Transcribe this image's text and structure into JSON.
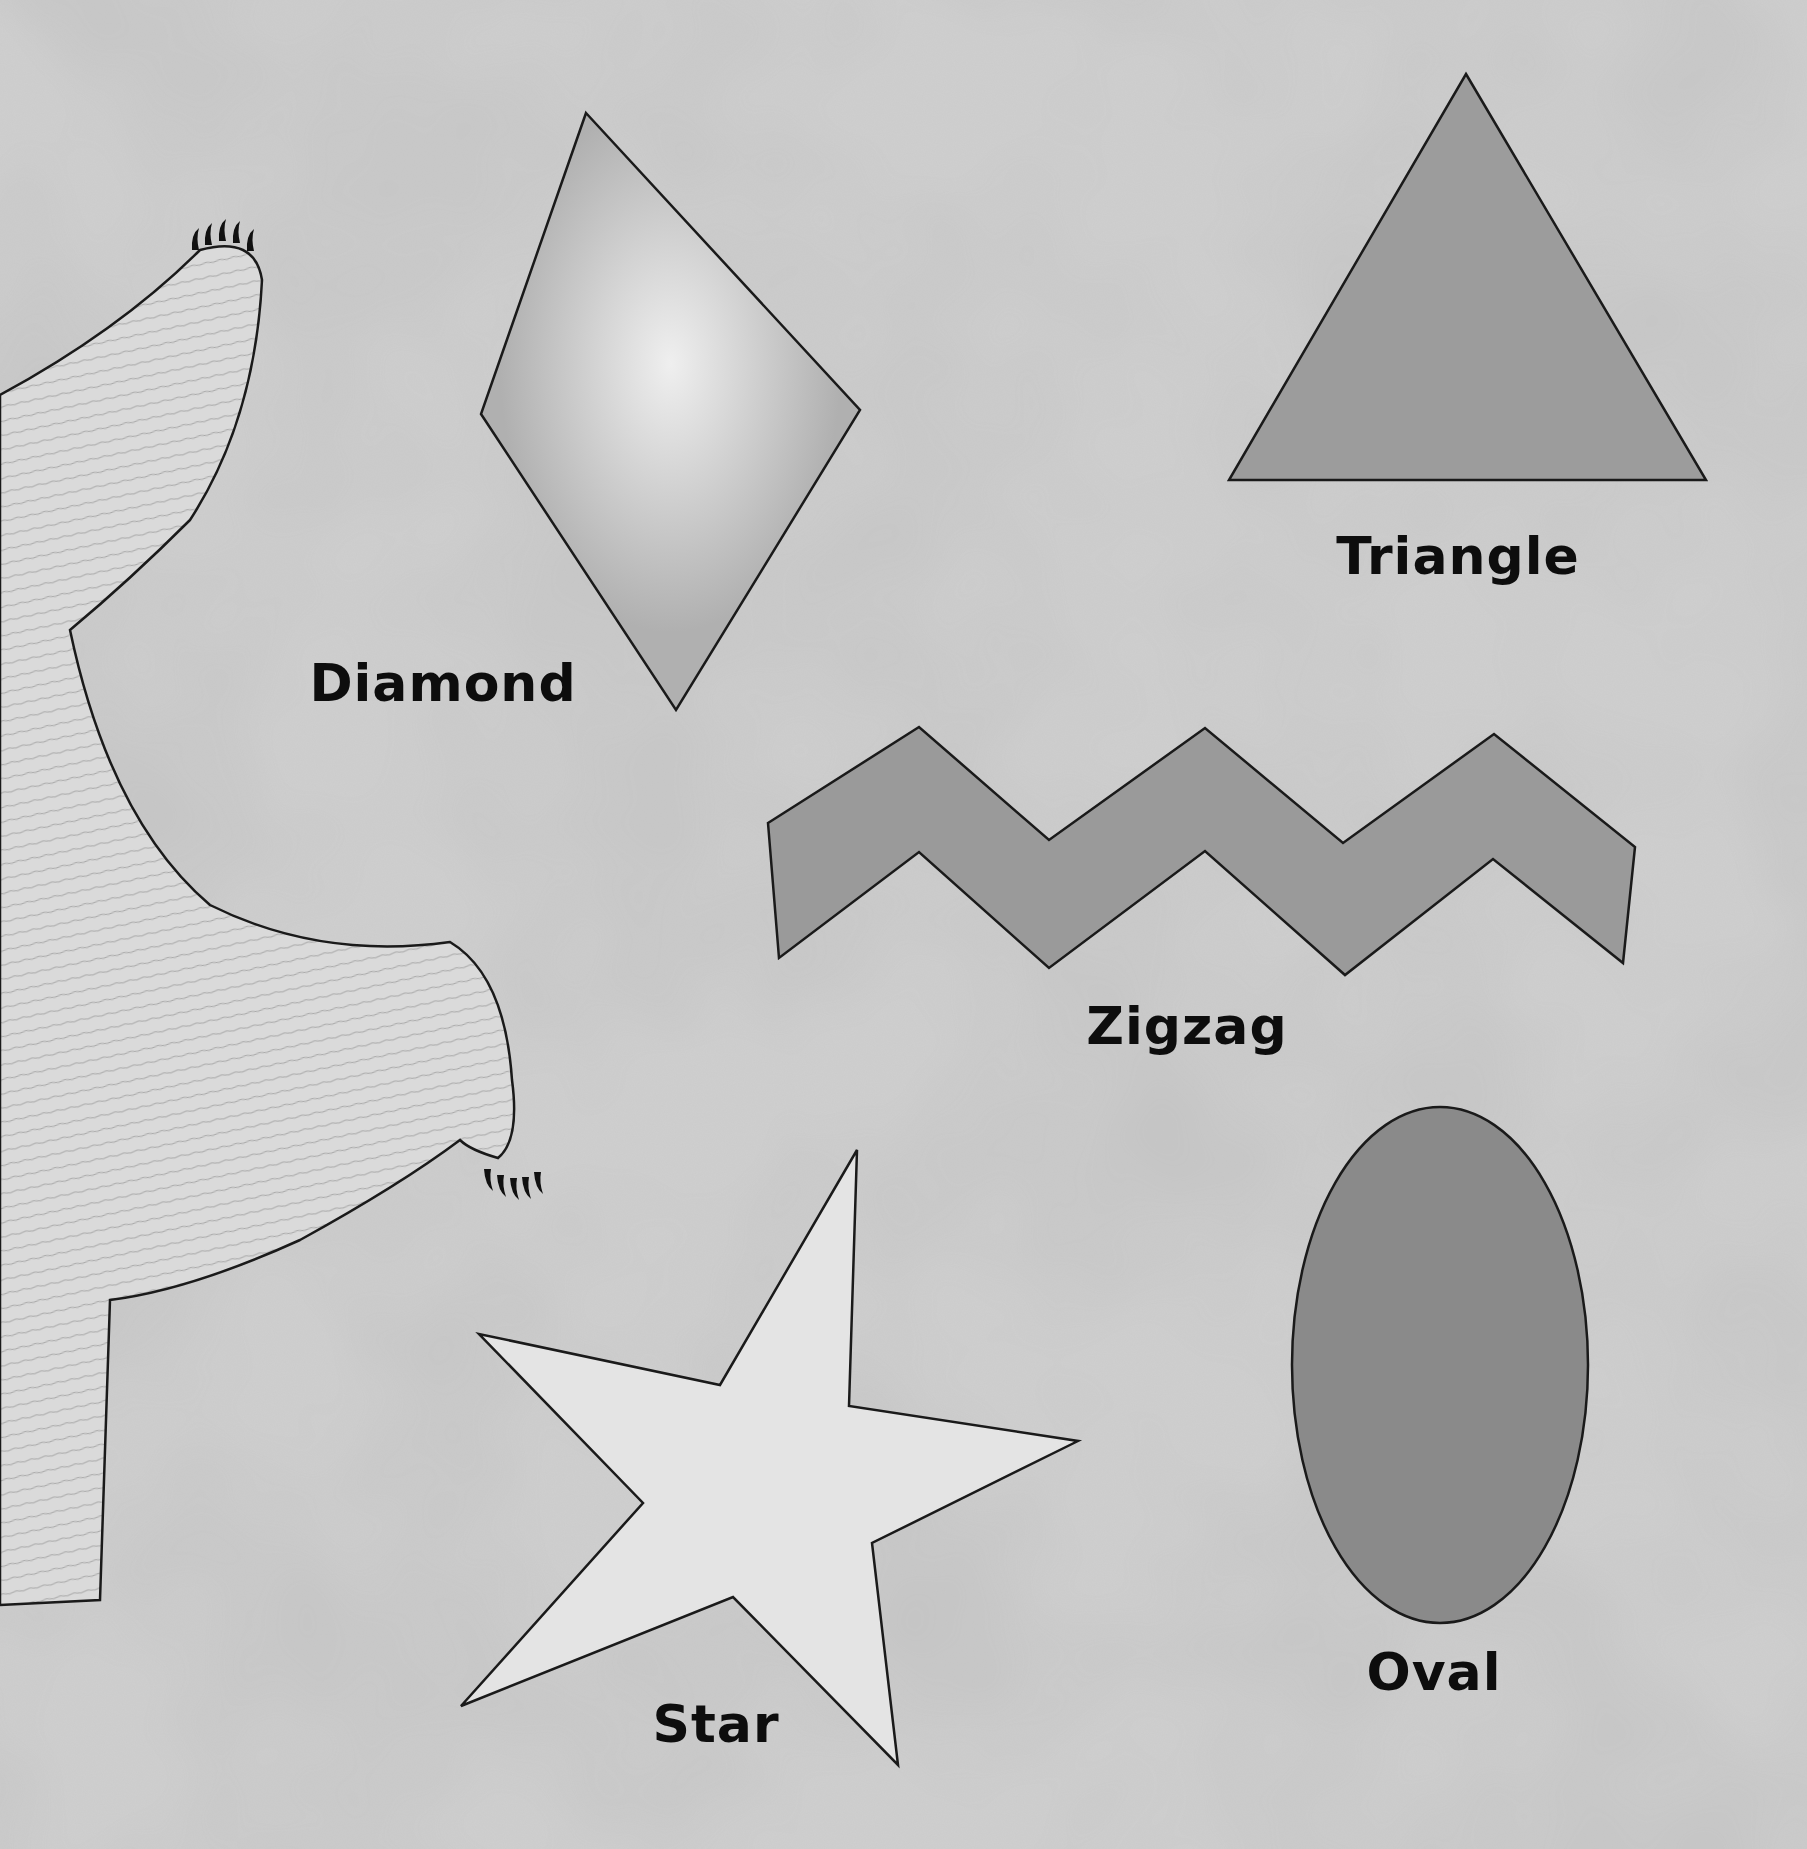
{
  "canvas": {
    "width": 1807,
    "height": 1849
  },
  "colors": {
    "paper": "#cfcfcf",
    "wash_dark": "#a9a9a9",
    "outline": "#1a1a1a",
    "diamond_fill": "#b2b2b2",
    "diamond_highlight": "#ececec",
    "triangle_fill": "#9c9c9c",
    "zigzag_fill": "#9a9a9a",
    "star_fill": "#e4e4e4",
    "oval_fill": "#8a8a8a",
    "creature_fur": "#dcdcdc",
    "label_text": "#0d0d0d"
  },
  "shapes": [
    {
      "id": "diamond",
      "label": "Diamond",
      "points": "586,113 860,410 676,710 481,414",
      "label_pos": [
        443,
        683
      ]
    },
    {
      "id": "triangle",
      "label": "Triangle",
      "points": "1466,74 1706,480 1229,480",
      "label_pos": [
        1458,
        556
      ]
    },
    {
      "id": "zigzag",
      "label": "Zigzag",
      "points": "768,823 919,727 1049,840 1205,728 1343,843 1494,734 1635,847 1623,963 1493,859 1345,975 1205,851 1049,968 919,852 779,958",
      "label_pos": [
        1187,
        1026
      ]
    },
    {
      "id": "star",
      "label": "Star",
      "points": "857,1150 849,1406 1078,1441 872,1543 898,1765 733,1597 461,1706 643,1503 479,1334 720,1385",
      "label_pos": [
        716,
        1724
      ]
    },
    {
      "id": "oval",
      "label": "Oval",
      "center": [
        1440,
        1365
      ],
      "rx": 148,
      "ry": 258,
      "label_pos": [
        1434,
        1672
      ]
    }
  ],
  "creature": {
    "description": "furry creature arm/leg reaching in from left edge with claws",
    "claws_top": [
      [
        195,
        244
      ],
      [
        208,
        239
      ],
      [
        222,
        235
      ],
      [
        236,
        237
      ],
      [
        250,
        245
      ]
    ],
    "claws_bottom": [
      [
        487,
        1175
      ],
      [
        500,
        1181
      ],
      [
        513,
        1184
      ],
      [
        525,
        1183
      ],
      [
        537,
        1178
      ]
    ]
  }
}
